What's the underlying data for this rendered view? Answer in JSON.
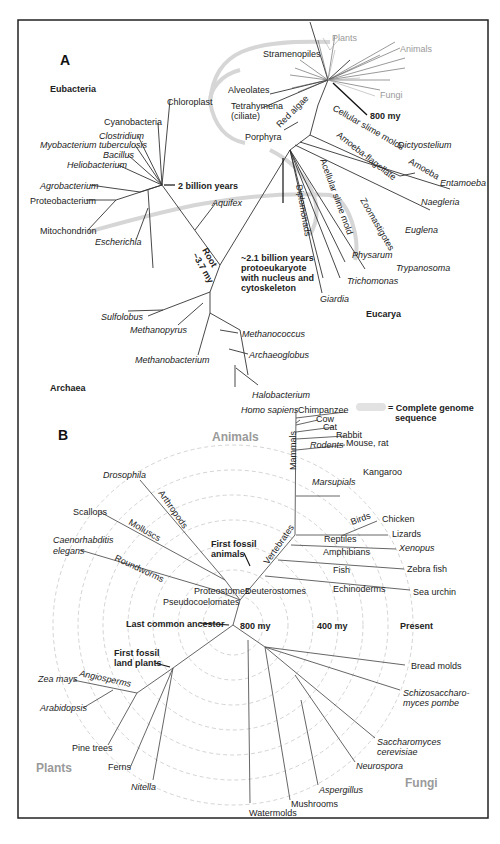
{
  "panel_a": {
    "label": "A",
    "domains": {
      "eubacteria": "Eubacteria",
      "archaea": "Archaea",
      "eucarya": "Eucarya"
    },
    "eubacteria_taxa": [
      "Chloroplast",
      "Cyanobacteria",
      "Clostridium",
      "Myobacterium tuberculosis",
      "Bacillus",
      "Heliobacterium",
      "Agrobacterium",
      "Proteobacterium",
      "Mitochondrion",
      "Escherichia",
      "Aquifex"
    ],
    "archaea_taxa": [
      "Sulfolobus",
      "Methanopyrus",
      "Methanobacterium",
      "Methanococcus",
      "Archaeoglobus",
      "Halobacterium"
    ],
    "eucarya_taxa": [
      "Stramenopiles",
      "Plants",
      "Animals",
      "Fungi",
      "Alveolates",
      "Tetrahymena",
      "(ciliate)",
      "Porphyra",
      "Red algae",
      "Cellular slime molds",
      "Dictyostelium",
      "Amoeba-flagellate",
      "Amoeba",
      "Entamoeba",
      "Naegleria",
      "Euglena",
      "Zoomastigotes",
      "Trypanosoma",
      "Acellular slime mold",
      "Physarum",
      "Trichomonas",
      "Diplomonads",
      "Giardia"
    ],
    "annotations": {
      "two_billion": "2 billion years",
      "my800": "800 my",
      "root_1": "Root",
      "root_2": "~3.7 my",
      "proto_1": "~2.1 billion years",
      "proto_2": "protoeukaryote",
      "proto_3": "with nucleus and",
      "proto_4": "cytoskeleton"
    },
    "legend": {
      "line1": "= Complete genome",
      "line2": "sequence"
    }
  },
  "panel_b": {
    "label": "B",
    "groups": {
      "animals": "Animals",
      "plants": "Plants",
      "fungi": "Fungi"
    },
    "animal_taxa": [
      "Homo sapiens",
      "Chimpanzee",
      "Cow",
      "Cat",
      "Rabbit",
      "Mouse, rat",
      "Rodents",
      "Kangaroo",
      "Marsupials",
      "Mammals",
      "Birds",
      "Chicken",
      "Lizards",
      "Reptiles",
      "Xenopus",
      "Amphibians",
      "Zebra fish",
      "Fish",
      "Sea urchin",
      "Echinoderms",
      "Vertebrates",
      "Deuterostomes",
      "Proteostomes",
      "Pseudocoelomates",
      "Drosophila",
      "Arthropods",
      "Scallops",
      "Molluscs",
      "Caenorhabditis",
      "elegans",
      "Roundworms"
    ],
    "plant_taxa": [
      "Zea mays",
      "Angiosperms",
      "Arabidopsis",
      "Pine trees",
      "Ferns",
      "Nitella"
    ],
    "fungi_taxa": [
      "Bread molds",
      "Schizosaccharo-",
      "myces pombe",
      "Saccharomyces",
      "cerevisiae",
      "Neurospora",
      "Aspergillus",
      "Mushrooms",
      "Watermolds"
    ],
    "annotations": {
      "first_fossil_animals_1": "First fossil",
      "first_fossil_animals_2": "animals",
      "lca": "Last common ancestor",
      "my800": "800 my",
      "my400": "400 my",
      "present": "Present",
      "first_fossil_plants_1": "First fossil",
      "first_fossil_plants_2": "land plants"
    }
  },
  "colors": {
    "line": "#333333",
    "highlight": "#d0d0d0",
    "gray_label": "#9a9a9a",
    "grid": "#c8c8c8",
    "frame": "#222222"
  }
}
